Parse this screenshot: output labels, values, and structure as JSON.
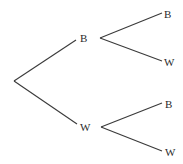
{
  "diagram": {
    "type": "probability-tree",
    "root": {
      "x": 14,
      "y": 81
    },
    "level1": [
      {
        "label": "B",
        "edge_from": [
          14,
          81
        ],
        "edge_to": [
          76,
          40
        ],
        "label_pos": [
          80,
          42
        ]
      },
      {
        "label": "W",
        "edge_from": [
          14,
          81
        ],
        "edge_to": [
          77,
          124
        ],
        "label_pos": [
          80,
          131
        ]
      }
    ],
    "level2": [
      {
        "parent": "B",
        "label": "B",
        "edge_from": [
          100,
          38
        ],
        "edge_to": [
          162,
          13
        ],
        "label_pos": [
          164,
          18
        ]
      },
      {
        "parent": "B",
        "label": "W",
        "edge_from": [
          100,
          38
        ],
        "edge_to": [
          162,
          61
        ],
        "label_pos": [
          164,
          66
        ]
      },
      {
        "parent": "W",
        "label": "B",
        "edge_from": [
          101,
          127
        ],
        "edge_to": [
          162,
          103
        ],
        "label_pos": [
          165,
          108
        ]
      },
      {
        "parent": "W",
        "label": "W",
        "edge_from": [
          101,
          127
        ],
        "edge_to": [
          162,
          151
        ],
        "label_pos": [
          165,
          156
        ]
      }
    ]
  }
}
